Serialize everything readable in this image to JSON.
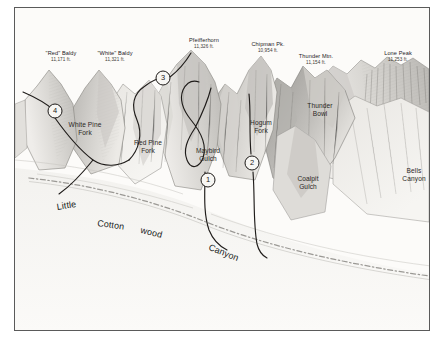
{
  "figure": {
    "kind": "panoramic-mountain-illustration",
    "border_color": "#5a5a5a",
    "paper_color": "#fdfdfc",
    "ink_color": "#24211f"
  },
  "peaks": [
    {
      "name": "\"Red\" Baldy",
      "elevation": "11,171 ft.",
      "x": 46,
      "y": 42
    },
    {
      "name": "\"White\" Baldy",
      "elevation": "11,321 ft.",
      "x": 100,
      "y": 42
    },
    {
      "name": "Pfeifferhorn",
      "elevation": "11,326 ft.",
      "x": 189,
      "y": 29
    },
    {
      "name": "Chipman Pk.",
      "elevation": "10,954 ft.",
      "x": 253,
      "y": 33
    },
    {
      "name": "Thunder Mtn.",
      "elevation": "11,154 ft.",
      "x": 301,
      "y": 45
    },
    {
      "name": "Lone Peak",
      "elevation": "11,253 ft.",
      "x": 383,
      "y": 42
    }
  ],
  "features": [
    {
      "label": "White Pine\nFork",
      "line1": "White Pine",
      "line2": "Fork",
      "x": 70,
      "y": 113
    },
    {
      "label": "Red Pine\nFork",
      "line1": "Red Pine",
      "line2": "Fork",
      "x": 133,
      "y": 131
    },
    {
      "label": "Maybird\nGulch",
      "line1": "Maybird",
      "line2": "Gulch",
      "x": 193,
      "y": 139
    },
    {
      "label": "Hogum\nFork",
      "line1": "Hogum",
      "line2": "Fork",
      "x": 246,
      "y": 111
    },
    {
      "label": "Thunder\nBowl",
      "line1": "Thunder",
      "line2": "Bowl",
      "x": 305,
      "y": 94
    },
    {
      "label": "Coalpit\nGulch",
      "line1": "Coalpit",
      "line2": "Gulch",
      "x": 293,
      "y": 167
    },
    {
      "label": "Bells\nCanyon",
      "line1": "Bells",
      "line2": "Canyon",
      "x": 399,
      "y": 159
    }
  ],
  "valley": {
    "full_name": "Little Cottonwood Canyon",
    "words": [
      {
        "text": "Little",
        "x": 41,
        "y": 194,
        "rotate": -9
      },
      {
        "text": "Cotton",
        "x": 83,
        "y": 210,
        "rotate": 8
      },
      {
        "text": "wood",
        "x": 127,
        "y": 217,
        "rotate": 14
      },
      {
        "text": "Canyon",
        "x": 196,
        "y": 234,
        "rotate": 22
      }
    ]
  },
  "markers": [
    {
      "number": "1",
      "x": 193,
      "y": 172
    },
    {
      "number": "2",
      "x": 237,
      "y": 155
    },
    {
      "number": "3",
      "x": 148,
      "y": 70
    },
    {
      "number": "4",
      "x": 40,
      "y": 103
    }
  ]
}
